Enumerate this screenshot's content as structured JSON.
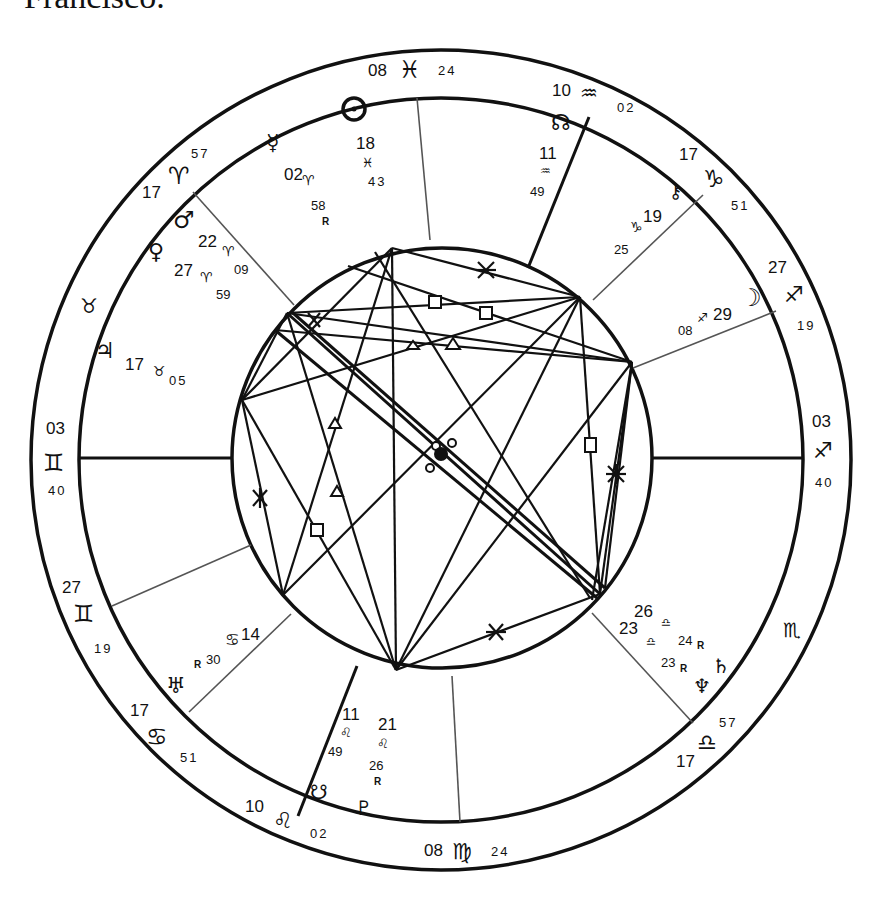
{
  "caption": {
    "text": "Francisco."
  },
  "wheel": {
    "center": [
      441,
      460
    ],
    "radii": {
      "outer": 410,
      "middle": 362,
      "inner": 210
    },
    "stroke_color": "#111111"
  },
  "sign_cusps": [
    {
      "id": "mc",
      "deg": "08",
      "sign": "pisces",
      "glyph": "♓",
      "min": "24"
    },
    {
      "id": "h11",
      "deg": "10",
      "sign": "aquarius",
      "glyph": "♒",
      "min": "02"
    },
    {
      "id": "h12",
      "deg": "17",
      "sign": "capricorn",
      "glyph": "♑",
      "min": "51"
    },
    {
      "id": "asc_r",
      "deg": "27",
      "sign": "sagittarius",
      "glyph": "♐",
      "min": "19"
    },
    {
      "id": "dsc",
      "deg": "03",
      "sign": "sagittarius",
      "glyph": "♐",
      "min": "40"
    },
    {
      "id": "scorp",
      "deg": "",
      "sign": "scorpio",
      "glyph": "♏",
      "min": ""
    },
    {
      "id": "h5",
      "deg": "17",
      "sign": "libra",
      "glyph": "♎",
      "min": "57"
    },
    {
      "id": "ic",
      "deg": "08",
      "sign": "virgo",
      "glyph": "♍",
      "min": "24"
    },
    {
      "id": "h3",
      "deg": "10",
      "sign": "leo",
      "glyph": "♌",
      "min": "02"
    },
    {
      "id": "h2",
      "deg": "17",
      "sign": "cancer",
      "glyph": "♋",
      "min": "51"
    },
    {
      "id": "h1b",
      "deg": "27",
      "sign": "gemini",
      "glyph": "♊",
      "min": "19"
    },
    {
      "id": "asc",
      "deg": "03",
      "sign": "gemini",
      "glyph": "♊",
      "min": "40"
    },
    {
      "id": "taur",
      "deg": "",
      "sign": "taurus",
      "glyph": "♉",
      "min": ""
    },
    {
      "id": "h11b",
      "deg": "17",
      "sign": "aries",
      "glyph": "♈",
      "min": "57"
    }
  ],
  "planets": [
    {
      "name": "sun",
      "glyph": "☉",
      "deg": "18",
      "sign_glyph": "♓",
      "min": "43",
      "retro": false
    },
    {
      "name": "mercury",
      "glyph": "☿",
      "deg": "02",
      "sign_glyph": "♈",
      "min": "58",
      "retro": true
    },
    {
      "name": "north-node",
      "glyph": "☊",
      "deg": "11",
      "sign_glyph": "♒",
      "min": "49",
      "retro": false
    },
    {
      "name": "chiron",
      "glyph": "⚷",
      "deg": "19",
      "sign_glyph": "♑",
      "min": "25",
      "retro": false
    },
    {
      "name": "moon",
      "glyph": "☽",
      "deg": "29",
      "sign_glyph": "♐",
      "min": "08",
      "retro": false
    },
    {
      "name": "mars",
      "glyph": "♂",
      "deg": "22",
      "sign_glyph": "♈",
      "min": "09",
      "retro": false
    },
    {
      "name": "venus",
      "glyph": "♀",
      "deg": "27",
      "sign_glyph": "♈",
      "min": "59",
      "retro": false
    },
    {
      "name": "jupiter",
      "glyph": "♃",
      "deg": "17",
      "sign_glyph": "♉",
      "min": "05",
      "retro": false
    },
    {
      "name": "uranus",
      "glyph": "♅",
      "deg": "14",
      "sign_glyph": "♋",
      "min": "30",
      "retro": true
    },
    {
      "name": "south-node",
      "glyph": "☋",
      "deg": "11",
      "sign_glyph": "♌",
      "min": "49",
      "retro": false
    },
    {
      "name": "pluto",
      "glyph": "♇",
      "deg": "21",
      "sign_glyph": "♌",
      "min": "26",
      "retro": true
    },
    {
      "name": "saturn",
      "glyph": "♄",
      "deg": "26",
      "sign_glyph": "♎",
      "min": "24",
      "retro": true
    },
    {
      "name": "neptune",
      "glyph": "♆",
      "deg": "23",
      "sign_glyph": "♎",
      "min": "23",
      "retro": true
    }
  ],
  "labels": {
    "retro_mark": "R",
    "mc_left": "08",
    "mc_glyph": "♓",
    "mc_right": "24",
    "h11_left": "10",
    "h11_glyph": "♒",
    "h11_right": "02",
    "h12_top": "17",
    "h12_glyph": "♑",
    "h12_right": "51",
    "sag_top": "27",
    "sag_glyph": "♐",
    "sag_bottom": "19",
    "dsc_top": "03",
    "dsc_glyph": "♐",
    "dsc_bottom": "40",
    "scorpio_glyph": "♏",
    "libra_right": "57",
    "libra_glyph": "♎",
    "libra_bottom": "17",
    "ic_left": "08",
    "ic_glyph": "♍",
    "ic_right": "24",
    "leo_left": "10",
    "leo_glyph": "♌",
    "leo_right": "02",
    "cancer_top": "17",
    "cancer_glyph": "♋",
    "cancer_right": "51",
    "gem2_top": "27",
    "gem2_glyph": "♊",
    "gem2_bottom": "19",
    "asc_top": "03",
    "asc_glyph": "♊",
    "asc_bottom": "40",
    "taurus_glyph": "♉",
    "aries_bottom": "17",
    "aries_glyph": "♈",
    "aries_right": "57",
    "sun_glyph": "☉",
    "sun_deg": "18",
    "sun_sign": "♓",
    "sun_min": "43",
    "mercury_glyph": "☿",
    "mercury_deg": "02",
    "mercury_sign": "♈",
    "mercury_min": "58",
    "node_glyph": "☊",
    "node_deg": "11",
    "node_sign": "♒",
    "node_min": "49",
    "chiron_glyph": "⚷",
    "chiron_deg": "19",
    "chiron_sign": "♑",
    "chiron_min": "25",
    "moon_glyph": "☽",
    "moon_deg": "29",
    "moon_sign": "♐",
    "moon_min": "08",
    "mars_glyph": "♂",
    "mars_deg": "22",
    "mars_sign": "♈",
    "mars_min": "09",
    "venus_glyph": "♀",
    "venus_deg": "27",
    "venus_sign": "♈",
    "venus_min": "59",
    "jupiter_glyph": "♃",
    "jupiter_deg": "17",
    "jupiter_sign": "♉",
    "jupiter_min": "05",
    "uranus_glyph": "♅",
    "uranus_deg": "14",
    "uranus_sign": "♋",
    "uranus_min": "30",
    "snode_glyph": "☋",
    "leo_node_deg": "11",
    "leo_node_sign": "♌",
    "leo_node_min": "49",
    "pluto_glyph": "♇",
    "pluto_deg": "21",
    "pluto_sign": "♌",
    "pluto_min": "26",
    "saturn_glyph": "♄",
    "saturn_deg": "26",
    "saturn_sign": "♎",
    "saturn_min": "24",
    "neptune_glyph": "♆",
    "neptune_deg": "23",
    "neptune_sign": "♎",
    "neptune_min": "23"
  },
  "aspect_glyphs": {
    "sextile": "✱",
    "square": "□",
    "trine": "△",
    "conjunction": "☌",
    "opposition": "☍",
    "semisextile": "⚺"
  }
}
